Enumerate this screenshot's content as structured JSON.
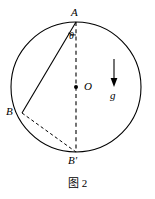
{
  "figure": {
    "caption": "图 2",
    "background_color": "#ffffff",
    "stroke_color": "#000000"
  },
  "labels": {
    "point_a": "A",
    "point_b": "B",
    "point_b_prime": "B'",
    "center_o": "O",
    "angle_theta": "θ",
    "gravity": "g"
  },
  "geometry": {
    "circle": {
      "cx": 76,
      "cy": 87,
      "r": 65
    },
    "point_a": {
      "x": 76,
      "y": 22
    },
    "point_b": {
      "x": 22,
      "y": 113
    },
    "point_b_prime": {
      "x": 76,
      "y": 152
    },
    "center_o": {
      "x": 76,
      "y": 87
    },
    "gravity_arrow": {
      "x": 114,
      "y_start": 59,
      "y_end": 86
    },
    "angle_arc_radius": 13
  }
}
